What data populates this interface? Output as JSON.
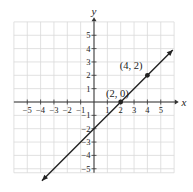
{
  "chart_data": {
    "type": "line",
    "title": "",
    "xlabel": "x",
    "ylabel": "y",
    "xlim": [
      -6,
      6
    ],
    "ylim": [
      -5.3,
      6
    ],
    "grid": true,
    "x_ticks": [
      -5,
      -4,
      -3,
      -2,
      -1,
      1,
      2,
      3,
      4,
      5
    ],
    "y_ticks": [
      5,
      4,
      3,
      2,
      1,
      -1,
      -2,
      -3,
      -4,
      -5
    ],
    "x_tick_labels": [
      "−5",
      "−4",
      "−3",
      "−2",
      "−1",
      "1",
      "2",
      "3",
      "4",
      "5"
    ],
    "y_tick_labels": [
      "5",
      "4",
      "3",
      "2",
      "1",
      "−1",
      "−2",
      "−3",
      "−4",
      "−5"
    ],
    "series": [
      {
        "name": "y = x - 2",
        "line": {
          "x": [
            -3.9,
            5.9
          ],
          "y": [
            -5.9,
            3.9
          ]
        },
        "arrows": "both"
      }
    ],
    "points": [
      {
        "x": 2,
        "y": 0,
        "label": "(2, 0)"
      },
      {
        "x": 4,
        "y": 2,
        "label": "(4, 2)"
      }
    ],
    "colors": {
      "line": "#222222",
      "grid": "#d9d9d9",
      "axis": "#333333"
    }
  }
}
